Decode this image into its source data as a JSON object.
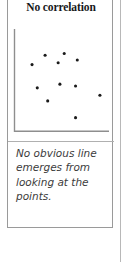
{
  "figure": {
    "title": "No correlation",
    "caption": "No obvious line emerges from looking at the points.",
    "colors": {
      "title_text": "#17181a",
      "caption_text": "#3c3c3c",
      "card_border": "#9a9a9a",
      "divider": "#b0b0b0",
      "axis": "#8e8e8e",
      "point": "#1b1b1b",
      "page_rule": "#b8b8b8",
      "background": "#ffffff"
    }
  },
  "chart_data": {
    "type": "scatter",
    "title": "No correlation",
    "subtitle": "",
    "xlabel": "",
    "ylabel": "",
    "xlim": [
      0,
      100
    ],
    "ylim": [
      0,
      100
    ],
    "xticks": [],
    "yticks": [],
    "grid": false,
    "legend": null,
    "annotations": [
      "No obvious line emerges from looking at the points."
    ],
    "axes_style": "left-and-bottom-spines-only",
    "series": [
      {
        "name": "points",
        "marker": "filled-square-dot",
        "color": "#1b1b1b",
        "points": [
          {
            "x": 30,
            "y": 76
          },
          {
            "x": 52,
            "y": 78
          },
          {
            "x": 15,
            "y": 66
          },
          {
            "x": 45,
            "y": 68
          },
          {
            "x": 67,
            "y": 71
          },
          {
            "x": 21,
            "y": 41
          },
          {
            "x": 47,
            "y": 45
          },
          {
            "x": 65,
            "y": 43
          },
          {
            "x": 93,
            "y": 33
          },
          {
            "x": 33,
            "y": 27
          },
          {
            "x": 65,
            "y": 9
          }
        ]
      }
    ]
  }
}
